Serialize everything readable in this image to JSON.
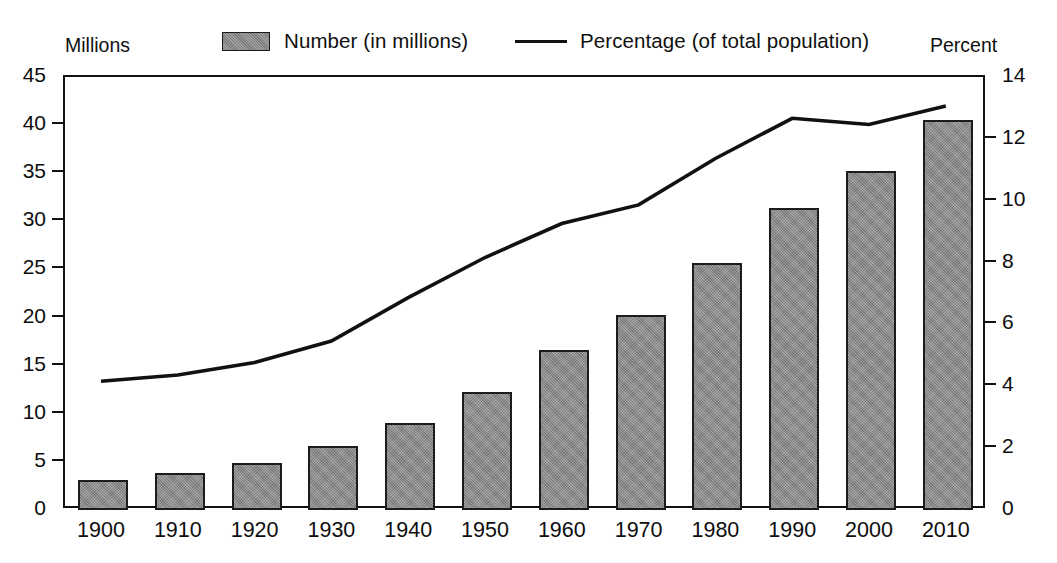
{
  "axis_captions": {
    "left": "Millions",
    "right": "Percent"
  },
  "legend": {
    "items": [
      {
        "label": "Number (in millions)",
        "marker": "filled-square-swatch",
        "color": "#898989"
      },
      {
        "label": "Percentage (of total population)",
        "marker": "solid-line",
        "color": "#111111"
      }
    ]
  },
  "chart_data": {
    "type": "bar",
    "title": "",
    "xlabel": "",
    "ylabel": "Millions",
    "y2label": "Percent",
    "grid": false,
    "legend_position": "top",
    "categories": [
      "1900",
      "1910",
      "1920",
      "1930",
      "1940",
      "1950",
      "1960",
      "1970",
      "1980",
      "1990",
      "2000",
      "2010"
    ],
    "series": [
      {
        "name": "Number (in millions)",
        "type": "bar",
        "axis": "left",
        "color": "#898989",
        "values": [
          3.1,
          3.8,
          4.9,
          6.6,
          9.0,
          12.3,
          16.6,
          20.3,
          25.7,
          31.4,
          35.2,
          40.5
        ]
      },
      {
        "name": "Percentage (of total population)",
        "type": "line",
        "axis": "right",
        "color": "#111111",
        "values": [
          4.1,
          4.3,
          4.7,
          5.4,
          6.8,
          8.1,
          9.2,
          9.8,
          11.3,
          12.6,
          12.4,
          13.0
        ]
      }
    ],
    "ylim": [
      0,
      45
    ],
    "yticks": [
      0,
      5,
      10,
      15,
      20,
      25,
      30,
      35,
      40,
      45
    ],
    "ytick_labels": [
      "0",
      "5",
      "10",
      "15",
      "20",
      "25",
      "30",
      "35",
      "40",
      "45"
    ],
    "y2lim": [
      0,
      14
    ],
    "y2ticks": [
      0,
      2,
      4,
      6,
      8,
      10,
      12,
      14
    ],
    "y2tick_labels": [
      "0",
      "2",
      "4",
      "6",
      "8",
      "10",
      "12",
      "14"
    ]
  },
  "geometry": {
    "plot_left": 63,
    "plot_right": 985,
    "plot_top": 75,
    "plot_bottom": 508,
    "bar_width": 50,
    "band_width": 76.8,
    "first_band_center": 101
  }
}
